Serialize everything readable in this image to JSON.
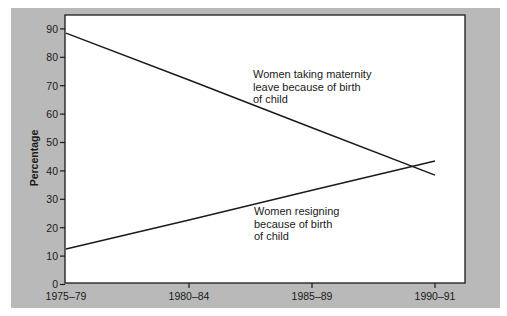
{
  "chart_data": {
    "type": "line",
    "title": "",
    "xlabel": "",
    "ylabel": "Percentage",
    "ylim": [
      0,
      90
    ],
    "yticks": [
      0,
      10,
      20,
      30,
      40,
      50,
      60,
      70,
      80,
      90
    ],
    "categories": [
      "1975–79",
      "1980–84",
      "1985–89",
      "1990–91"
    ],
    "grid": false,
    "legend": "none (direct annotations)",
    "series": [
      {
        "name": "Women taking maternity leave because of birth of child",
        "values": [
          88.5,
          72.0,
          55.2,
          38.5
        ],
        "color": "#1a1a1a"
      },
      {
        "name": "Women resigning because of birth of child",
        "values": [
          12.5,
          22.7,
          33.2,
          43.5
        ],
        "color": "#1a1a1a"
      }
    ],
    "annotations": [
      {
        "lines": [
          "Women taking maternity",
          "leave because of birth",
          "of child"
        ],
        "series": 0
      },
      {
        "lines": [
          "Women resigning",
          "because of birth",
          "of child"
        ],
        "series": 1
      }
    ]
  },
  "colors": {
    "panel": "#b9b9b9",
    "plot_bg": "#ffffff",
    "ink": "#1a1a1a"
  }
}
